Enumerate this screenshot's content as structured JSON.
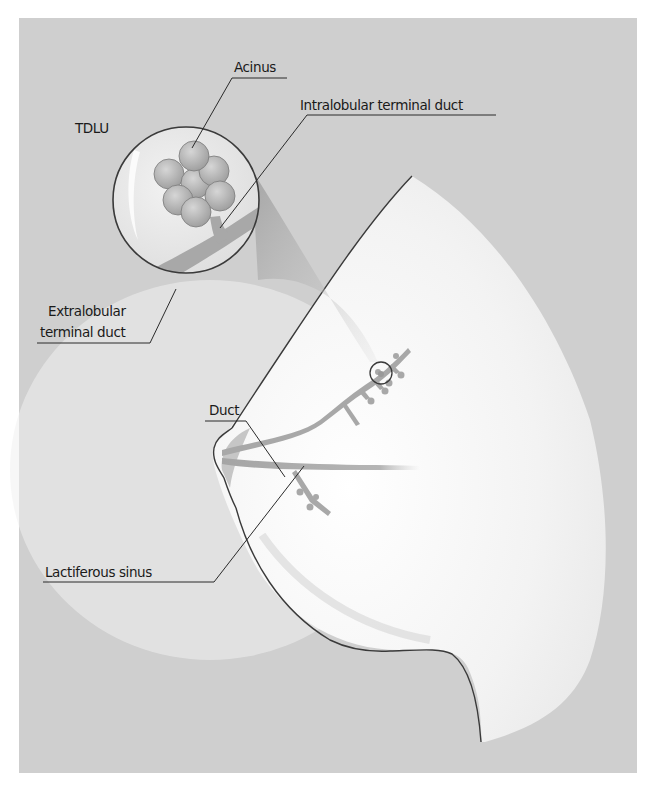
{
  "diagram": {
    "colors": {
      "background_panel": "#cfcfcf",
      "tissue": "#f4f4f4",
      "duct": "#a9a9a9",
      "acinus": "#b3b3b3",
      "outline": "#3a3a3a",
      "label_text": "#1a1a1a"
    },
    "labels": {
      "acinus": "Acinus",
      "tdlu": "TDLU",
      "intralobular": "Intralobular terminal duct",
      "extralobular_line1": "Extralobular",
      "extralobular_line2": "terminal duct",
      "duct": "Duct",
      "lactiferous_sinus": "Lactiferous sinus"
    }
  }
}
